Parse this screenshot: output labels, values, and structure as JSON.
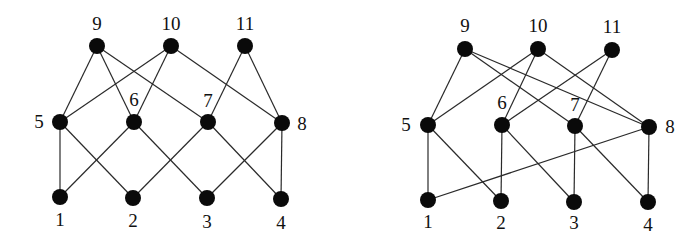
{
  "graphs": [
    {
      "id": "left",
      "nodes": [
        {
          "id": "1",
          "label": "1",
          "x": 60,
          "y": 197,
          "lx": 60,
          "ly": 222
        },
        {
          "id": "2",
          "label": "2",
          "x": 133,
          "y": 198,
          "lx": 133,
          "ly": 223
        },
        {
          "id": "3",
          "label": "3",
          "x": 207,
          "y": 198,
          "lx": 207,
          "ly": 224
        },
        {
          "id": "4",
          "label": "4",
          "x": 281,
          "y": 199,
          "lx": 281,
          "ly": 225
        },
        {
          "id": "5",
          "label": "5",
          "x": 60,
          "y": 122,
          "lx": 39,
          "ly": 124
        },
        {
          "id": "6",
          "label": "6",
          "x": 134,
          "y": 122,
          "lx": 134,
          "ly": 102
        },
        {
          "id": "7",
          "label": "7",
          "x": 208,
          "y": 122,
          "lx": 208,
          "ly": 103
        },
        {
          "id": "8",
          "label": "8",
          "x": 282,
          "y": 123,
          "lx": 302,
          "ly": 126
        },
        {
          "id": "9",
          "label": "9",
          "x": 97,
          "y": 46,
          "lx": 97,
          "ly": 26
        },
        {
          "id": "10",
          "label": "10",
          "x": 171,
          "y": 46,
          "lx": 171,
          "ly": 26
        },
        {
          "id": "11",
          "label": "11",
          "x": 245,
          "y": 46,
          "lx": 245,
          "ly": 26
        }
      ],
      "edges": [
        [
          "9",
          "5"
        ],
        [
          "9",
          "6"
        ],
        [
          "9",
          "7"
        ],
        [
          "10",
          "5"
        ],
        [
          "10",
          "6"
        ],
        [
          "10",
          "8"
        ],
        [
          "11",
          "7"
        ],
        [
          "11",
          "8"
        ],
        [
          "5",
          "1"
        ],
        [
          "5",
          "2"
        ],
        [
          "6",
          "1"
        ],
        [
          "6",
          "3"
        ],
        [
          "7",
          "2"
        ],
        [
          "7",
          "4"
        ],
        [
          "8",
          "3"
        ],
        [
          "8",
          "4"
        ]
      ]
    },
    {
      "id": "right",
      "nodes": [
        {
          "id": "1",
          "label": "1",
          "x": 428,
          "y": 200,
          "lx": 428,
          "ly": 224
        },
        {
          "id": "2",
          "label": "2",
          "x": 501,
          "y": 201,
          "lx": 501,
          "ly": 225
        },
        {
          "id": "3",
          "label": "3",
          "x": 574,
          "y": 202,
          "lx": 574,
          "ly": 225
        },
        {
          "id": "4",
          "label": "4",
          "x": 648,
          "y": 202,
          "lx": 648,
          "ly": 227
        },
        {
          "id": "5",
          "label": "5",
          "x": 428,
          "y": 125,
          "lx": 406,
          "ly": 127
        },
        {
          "id": "6",
          "label": "6",
          "x": 502,
          "y": 125,
          "lx": 502,
          "ly": 105
        },
        {
          "id": "7",
          "label": "7",
          "x": 575,
          "y": 126,
          "lx": 575,
          "ly": 107
        },
        {
          "id": "8",
          "label": "8",
          "x": 649,
          "y": 127,
          "lx": 670,
          "ly": 129
        },
        {
          "id": "9",
          "label": "9",
          "x": 465,
          "y": 49,
          "lx": 465,
          "ly": 28
        },
        {
          "id": "10",
          "label": "10",
          "x": 538,
          "y": 49,
          "lx": 538,
          "ly": 28
        },
        {
          "id": "11",
          "label": "11",
          "x": 612,
          "y": 50,
          "lx": 612,
          "ly": 29
        }
      ],
      "edges": [
        [
          "9",
          "5"
        ],
        [
          "9",
          "7"
        ],
        [
          "9",
          "8"
        ],
        [
          "10",
          "5"
        ],
        [
          "10",
          "6"
        ],
        [
          "10",
          "8"
        ],
        [
          "11",
          "6"
        ],
        [
          "11",
          "7"
        ],
        [
          "5",
          "1"
        ],
        [
          "5",
          "2"
        ],
        [
          "6",
          "2"
        ],
        [
          "6",
          "3"
        ],
        [
          "7",
          "3"
        ],
        [
          "7",
          "4"
        ],
        [
          "8",
          "1"
        ],
        [
          "8",
          "4"
        ]
      ]
    }
  ],
  "style": {
    "node_color": "#0a0a0a",
    "edge_color": "#2a2a2a",
    "node_radius": 8
  }
}
